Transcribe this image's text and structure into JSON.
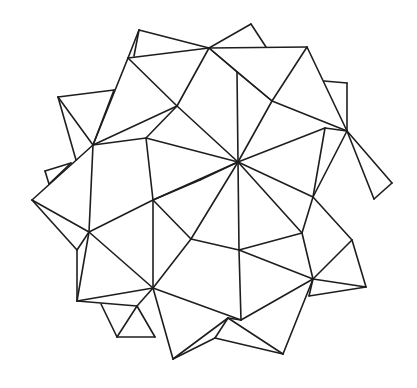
{
  "figure": {
    "title": "",
    "background": "#ffffff",
    "stroke": "#1e1e1e",
    "edges": [
      [
        139,
        30,
        209,
        48
      ],
      [
        139,
        30,
        128,
        58
      ],
      [
        139,
        30,
        134,
        56
      ],
      [
        128,
        58,
        209,
        48
      ],
      [
        209,
        48,
        251,
        24
      ],
      [
        251,
        24,
        266,
        47
      ],
      [
        209,
        48,
        307,
        47
      ],
      [
        128,
        58,
        93,
        145
      ],
      [
        128,
        58,
        177,
        106
      ],
      [
        209,
        48,
        177,
        106
      ],
      [
        58,
        97,
        114,
        90
      ],
      [
        58,
        97,
        93,
        145
      ],
      [
        58,
        97,
        76,
        160
      ],
      [
        114,
        90,
        93,
        145
      ],
      [
        93,
        145,
        177,
        106
      ],
      [
        93,
        145,
        146,
        138
      ],
      [
        146,
        138,
        177,
        106
      ],
      [
        177,
        106,
        238,
        162
      ],
      [
        146,
        138,
        238,
        162
      ],
      [
        146,
        138,
        153,
        200
      ],
      [
        209,
        48,
        237,
        72
      ],
      [
        237,
        72,
        272,
        101
      ],
      [
        209,
        48,
        272,
        101
      ],
      [
        272,
        101,
        347,
        131
      ],
      [
        237,
        72,
        238,
        162
      ],
      [
        272,
        101,
        238,
        162
      ],
      [
        307,
        47,
        272,
        101
      ],
      [
        307,
        47,
        347,
        131
      ],
      [
        324,
        81,
        347,
        83
      ],
      [
        347,
        83,
        347,
        131
      ],
      [
        347,
        131,
        392,
        183
      ],
      [
        392,
        183,
        374,
        199
      ],
      [
        347,
        131,
        374,
        199
      ],
      [
        347,
        131,
        325,
        128
      ],
      [
        325,
        128,
        238,
        162
      ],
      [
        325,
        128,
        313,
        197
      ],
      [
        347,
        131,
        313,
        197
      ],
      [
        238,
        162,
        313,
        197
      ],
      [
        238,
        162,
        200,
        180
      ],
      [
        200,
        180,
        153,
        200
      ],
      [
        93,
        145,
        32,
        200
      ],
      [
        93,
        145,
        89,
        232
      ],
      [
        45,
        171,
        71,
        163
      ],
      [
        45,
        171,
        49,
        184
      ],
      [
        49,
        184,
        71,
        163
      ],
      [
        32,
        200,
        89,
        232
      ],
      [
        32,
        200,
        77,
        250
      ],
      [
        77,
        250,
        89,
        232
      ],
      [
        77,
        250,
        77,
        301
      ],
      [
        89,
        232,
        153,
        288
      ],
      [
        89,
        232,
        153,
        200
      ],
      [
        89,
        232,
        77,
        301
      ],
      [
        153,
        200,
        153,
        288
      ],
      [
        153,
        200,
        238,
        162
      ],
      [
        153,
        200,
        191,
        239
      ],
      [
        191,
        239,
        238,
        162
      ],
      [
        191,
        239,
        153,
        288
      ],
      [
        191,
        239,
        239,
        250
      ],
      [
        238,
        162,
        239,
        250
      ],
      [
        238,
        162,
        302,
        233
      ],
      [
        313,
        197,
        302,
        233
      ],
      [
        313,
        197,
        352,
        240
      ],
      [
        302,
        233,
        239,
        250
      ],
      [
        302,
        233,
        313,
        279
      ],
      [
        313,
        279,
        352,
        240
      ],
      [
        313,
        279,
        366,
        287
      ],
      [
        352,
        240,
        366,
        287
      ],
      [
        366,
        287,
        309,
        296
      ],
      [
        313,
        279,
        309,
        296
      ],
      [
        239,
        250,
        313,
        279
      ],
      [
        239,
        250,
        241,
        320
      ],
      [
        241,
        320,
        313,
        279
      ],
      [
        153,
        288,
        77,
        301
      ],
      [
        77,
        301,
        137,
        306
      ],
      [
        137,
        306,
        153,
        288
      ],
      [
        137,
        306,
        117,
        337
      ],
      [
        117,
        337,
        155,
        337
      ],
      [
        101,
        304,
        117,
        337
      ],
      [
        155,
        337,
        137,
        306
      ],
      [
        153,
        288,
        173,
        359
      ],
      [
        173,
        359,
        228,
        318
      ],
      [
        153,
        288,
        241,
        320
      ],
      [
        228,
        318,
        241,
        320
      ],
      [
        228,
        318,
        283,
        354
      ],
      [
        283,
        354,
        313,
        279
      ],
      [
        215,
        338,
        283,
        354
      ],
      [
        215,
        338,
        228,
        318
      ],
      [
        173,
        359,
        215,
        338
      ]
    ]
  }
}
